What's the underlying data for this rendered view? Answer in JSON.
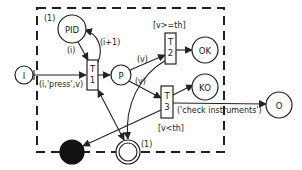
{
  "diagram": {
    "type": "petri-net",
    "boundary": {
      "style": "dashed",
      "x": 37,
      "y": 8,
      "width": 187,
      "height": 144
    },
    "places": [
      {
        "id": "I",
        "label": "I",
        "cx": 24,
        "cy": 75,
        "r": 9
      },
      {
        "id": "PID",
        "label": "PID",
        "cx": 72,
        "cy": 29,
        "r": 14,
        "marking": "(1)"
      },
      {
        "id": "P",
        "label": "P",
        "cx": 121,
        "cy": 75,
        "r": 10
      },
      {
        "id": "OK",
        "label": "OK",
        "cx": 205,
        "cy": 50,
        "r": 13
      },
      {
        "id": "KO",
        "label": "KO",
        "cx": 205,
        "cy": 87,
        "r": 13
      },
      {
        "id": "O",
        "label": "O",
        "cx": 279,
        "cy": 105,
        "r": 13
      },
      {
        "id": "start",
        "label": "",
        "cx": 72,
        "cy": 152,
        "r": 12,
        "style": "filled",
        "color": "#111111"
      },
      {
        "id": "end",
        "label": "",
        "cx": 128,
        "cy": 152,
        "r": 12,
        "style": "double",
        "marking": "(1)"
      }
    ],
    "transitions": [
      {
        "id": "T1",
        "label_line1": "T",
        "label_line2": "1",
        "x": 87,
        "y": 60,
        "w": 11,
        "h": 30
      },
      {
        "id": "T2",
        "label_line1": "T",
        "label_line2": "2",
        "x": 165,
        "y": 33,
        "w": 11,
        "h": 31,
        "guard": "[v>=th]"
      },
      {
        "id": "T3",
        "label_line1": "T",
        "label_line2": "3",
        "x": 161,
        "y": 86,
        "w": 12,
        "h": 32,
        "guard": "[v<th]"
      }
    ],
    "arc_labels": {
      "pid_to_t1": "(i)",
      "t1_to_pid": "(i+1)",
      "i_to_t1": "(i,'press',v)",
      "p_to_t2": "(v)",
      "p_to_t3": "(v)",
      "t3_to_o": "('check instruments')"
    },
    "markings": {
      "pid": "(1)",
      "end": "(1)"
    }
  }
}
